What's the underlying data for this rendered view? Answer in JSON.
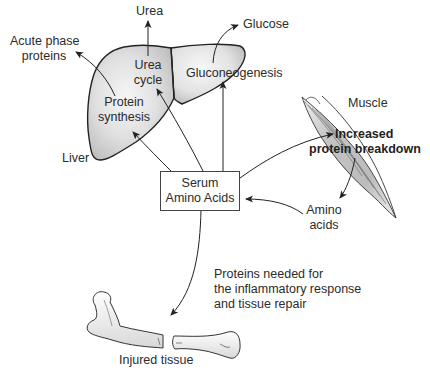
{
  "diagram": {
    "organs": {
      "liver": {
        "label": "Liver",
        "processes": {
          "urea_cycle": [
            "Urea",
            "cycle"
          ],
          "gluconeogenesis": "Gluconeogenesis",
          "protein_synthesis": [
            "Protein",
            "synthesis"
          ]
        }
      },
      "muscle": {
        "label": "Muscle",
        "process": [
          "Increased",
          "protein breakdown"
        ]
      },
      "injured_tissue": {
        "label": "Injured tissue"
      }
    },
    "products": {
      "urea": "Urea",
      "glucose": "Glucose",
      "acute_phase_proteins": [
        "Acute phase",
        "proteins"
      ],
      "amino_acids": [
        "Amino",
        "acids"
      ]
    },
    "central_node": {
      "label": [
        "Serum",
        "Amino Acids"
      ]
    },
    "annotation": [
      "Proteins needed for",
      "the inflammatory response",
      "and tissue repair"
    ],
    "edges": [
      {
        "from": "Serum Amino Acids",
        "to": "Protein synthesis"
      },
      {
        "from": "Serum Amino Acids",
        "to": "Urea cycle"
      },
      {
        "from": "Serum Amino Acids",
        "to": "Gluconeogenesis"
      },
      {
        "from": "Serum Amino Acids",
        "to": "Increased protein breakdown"
      },
      {
        "from": "Increased protein breakdown",
        "to": "Amino acids"
      },
      {
        "from": "Amino acids",
        "to": "Serum Amino Acids"
      },
      {
        "from": "Urea cycle",
        "to": "Urea"
      },
      {
        "from": "Gluconeogenesis",
        "to": "Glucose"
      },
      {
        "from": "Protein synthesis",
        "to": "Acute phase proteins"
      },
      {
        "from": "Serum Amino Acids",
        "to": "Injured tissue"
      }
    ],
    "colors": {
      "line": "#2a2a2a",
      "organ_fill": "#d6d6d6",
      "organ_highlight": "#f4f4f4"
    }
  }
}
